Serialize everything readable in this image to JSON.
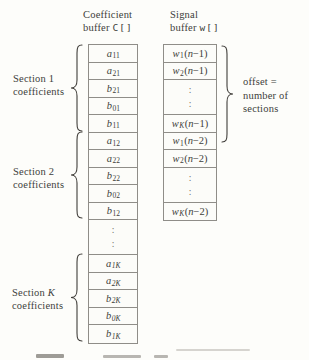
{
  "colors": {
    "paper": "#fdfdfa",
    "ink": "#403e3a",
    "border": "#8f8d88"
  },
  "headers": {
    "coefficient": {
      "title": "Coefficient",
      "buffer_word": "buffer",
      "array": "C[]"
    },
    "signal": {
      "title": "Signal",
      "buffer_word": "buffer",
      "array": "w[]"
    }
  },
  "coefficient_buffer": {
    "cells": [
      {
        "var": "a",
        "sub": "11"
      },
      {
        "var": "a",
        "sub": "21"
      },
      {
        "var": "b",
        "sub": "21"
      },
      {
        "var": "b",
        "sub": "01"
      },
      {
        "var": "b",
        "sub": "11"
      },
      {
        "var": "a",
        "sub": "12"
      },
      {
        "var": "a",
        "sub": "22"
      },
      {
        "var": "b",
        "sub": "22"
      },
      {
        "var": "b",
        "sub": "02"
      },
      {
        "var": "b",
        "sub": "12"
      },
      {
        "dots": true
      },
      {
        "var": "a",
        "sub": "1K"
      },
      {
        "var": "a",
        "sub": "2K"
      },
      {
        "var": "b",
        "sub": "2K"
      },
      {
        "var": "b",
        "sub": "0K"
      },
      {
        "var": "b",
        "sub": "1K"
      }
    ]
  },
  "signal_buffer": {
    "cells": [
      {
        "var": "w",
        "sub": "1",
        "arg": "n−1"
      },
      {
        "var": "w",
        "sub": "2",
        "arg": "n−1"
      },
      {
        "dots": true
      },
      {
        "var": "w",
        "sub": "K",
        "arg": "n−1"
      },
      {
        "var": "w",
        "sub": "1",
        "arg": "n−2"
      },
      {
        "var": "w",
        "sub": "2",
        "arg": "n−2"
      },
      {
        "dots": true
      },
      {
        "var": "w",
        "sub": "K",
        "arg": "n−2"
      }
    ]
  },
  "annotations": {
    "section1": {
      "word": "Section",
      "num": "1",
      "noun": "coefficients"
    },
    "section2": {
      "word": "Section",
      "num": "2",
      "noun": "coefficients"
    },
    "sectionK": {
      "word": "Section",
      "num": "K",
      "noun": "coefficients"
    },
    "offset": {
      "line1": "offset =",
      "line2": "number of",
      "line3": "sections"
    }
  },
  "dots_char": ":"
}
